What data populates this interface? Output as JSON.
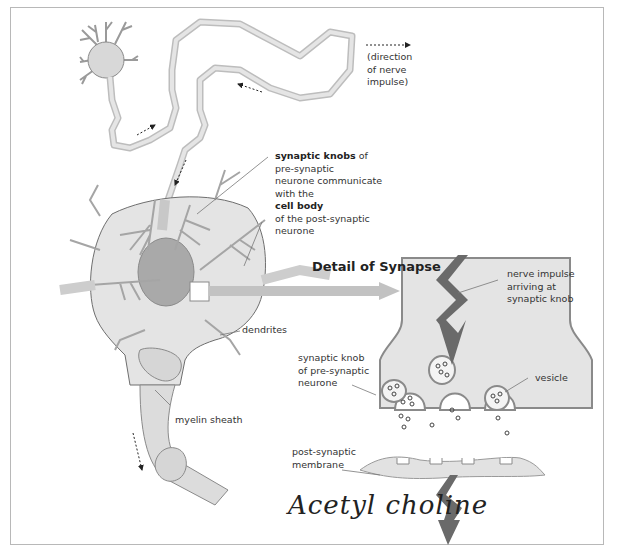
{
  "diagram": {
    "title": "Detail of Synapse",
    "labels": {
      "direction": [
        "(direction",
        "of nerve",
        "impulse)"
      ],
      "synaptic_knobs_bold": "synaptic knobs",
      "synaptic_knobs_rest1": " of",
      "synaptic_knobs_lines": [
        "pre-synaptic",
        "neurone communicate",
        "with the"
      ],
      "cell_body_bold": "cell body",
      "cell_body_lines": [
        "of the post-synaptic",
        "neurone"
      ],
      "dendrites": "dendrites",
      "myelin_sheath": "myelin sheath",
      "nerve_impulse": [
        "nerve impulse",
        "arriving at",
        "synaptic knob"
      ],
      "synaptic_knob": [
        "synaptic knob",
        "of pre-synaptic",
        "neurone"
      ],
      "vesicle": "vesicle",
      "post_synaptic": [
        "post-synaptic",
        "membrane"
      ],
      "handwritten": "Acetyl choline"
    },
    "colors": {
      "fill_light": "#e2e2e2",
      "fill_mid": "#cfcfcf",
      "fill_dark": "#9a9a9a",
      "stroke": "#8a8a8a",
      "arrow_dark": "#5a5a5a",
      "text": "#333333"
    }
  }
}
